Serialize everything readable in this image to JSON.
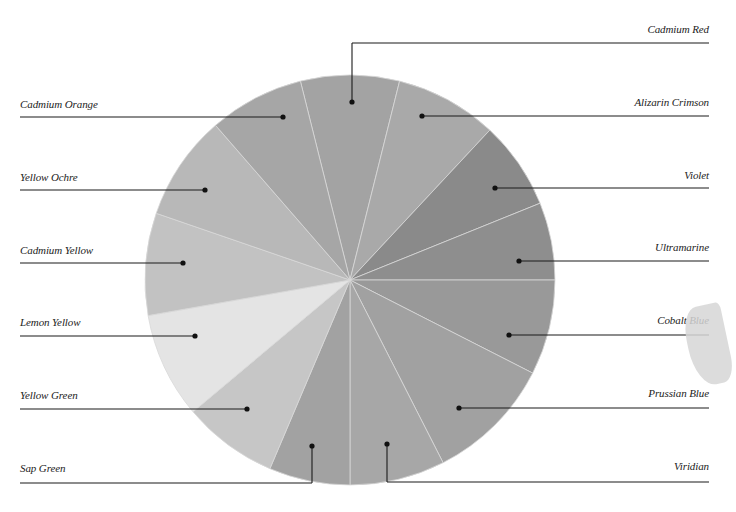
{
  "figure": {
    "type": "color-wheel",
    "center": [
      350,
      280
    ],
    "radius": 205,
    "segments": [
      {
        "name": "Cadmium Red",
        "gray": "#a3a3a3",
        "start": -104,
        "end": -76
      },
      {
        "name": "Alizarin Crimson",
        "gray": "#a9a9a9",
        "start": -76,
        "end": -47
      },
      {
        "name": "Violet",
        "gray": "#8a8a8a",
        "start": -47,
        "end": -22
      },
      {
        "name": "Ultramarine",
        "gray": "#8e8e8e",
        "start": -22,
        "end": 0
      },
      {
        "name": "Cobalt Blue",
        "gray": "#999999",
        "start": 0,
        "end": 27
      },
      {
        "name": "Prussian Blue",
        "gray": "#a1a1a1",
        "start": 27,
        "end": 63
      },
      {
        "name": "Viridian",
        "gray": "#a7a7a7",
        "start": 63,
        "end": 90
      },
      {
        "name": "Sap Green",
        "gray": "#a2a2a2",
        "start": 90,
        "end": 113
      },
      {
        "name": "Yellow Green",
        "gray": "#c6c6c6",
        "start": 113,
        "end": 140
      },
      {
        "name": "Lemon Yellow",
        "gray": "#e4e4e4",
        "start": 140,
        "end": 170
      },
      {
        "name": "Cadmium Yellow",
        "gray": "#c2c2c2",
        "start": 170,
        "end": 199
      },
      {
        "name": "Yellow Ochre",
        "gray": "#b8b8b8",
        "start": 199,
        "end": 229
      },
      {
        "name": "Cadmium Orange",
        "gray": "#a6a6a6",
        "start": 229,
        "end": 256
      }
    ]
  },
  "labels": {
    "left": [
      {
        "text": "Cadmium Orange",
        "text_y": 104,
        "line_y": 117,
        "dot": [
          283,
          117
        ]
      },
      {
        "text": "Yellow Ochre",
        "text_y": 177,
        "line_y": 190,
        "dot": [
          205,
          190
        ]
      },
      {
        "text": "Cadmium Yellow",
        "text_y": 250,
        "line_y": 263,
        "dot": [
          183,
          263
        ]
      },
      {
        "text": "Lemon Yellow",
        "text_y": 322,
        "line_y": 336,
        "dot": [
          195,
          336
        ]
      },
      {
        "text": "Yellow Green",
        "text_y": 395,
        "line_y": 409,
        "dot": [
          247,
          409
        ]
      },
      {
        "text": "Sap Green",
        "text_y": 468,
        "line_y": 483,
        "dot": [
          312,
          446
        ]
      }
    ],
    "right": [
      {
        "text": "Cadmium Red",
        "text_y": 29,
        "line_y": 43,
        "dot": [
          352,
          102
        ]
      },
      {
        "text": "Alizarin Crimson",
        "text_y": 102,
        "line_y": 116,
        "dot": [
          422,
          116
        ]
      },
      {
        "text": "Violet",
        "text_y": 175,
        "line_y": 188,
        "dot": [
          495,
          188
        ]
      },
      {
        "text": "Ultramarine",
        "text_y": 247,
        "line_y": 261,
        "dot": [
          519,
          261
        ]
      },
      {
        "text": "Cobalt Blue",
        "text_y": 320,
        "line_y": 335,
        "dot": [
          509,
          335
        ]
      },
      {
        "text": "Prussian Blue",
        "text_y": 393,
        "line_y": 408,
        "dot": [
          459,
          408
        ]
      },
      {
        "text": "Viridian",
        "text_y": 466,
        "line_y": 482,
        "dot": [
          387,
          444
        ]
      }
    ]
  }
}
